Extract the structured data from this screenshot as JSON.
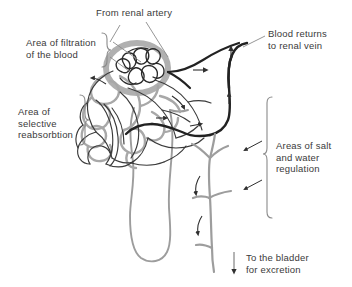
{
  "figure": {
    "background_color": "#ffffff",
    "tubule_color": "#9a9a9a",
    "vessel_color": "#333333",
    "text_color": "#3a3a3a"
  },
  "labels": {
    "renal_artery": "From renal artery",
    "filtration": "Area of filtration\nof the blood",
    "reabsorbtion": "Area of\nselective\nreabsorbtion",
    "renal_vein": "Blood returns\nto renal vein",
    "salt_water": "Areas of salt\nand water\nregulation",
    "bladder": "To the bladder\nfor excretion"
  },
  "icons": {
    "brace_right": "brace-right-icon",
    "brace_left": "brace-left-icon",
    "arrow_down": "arrow-down-icon",
    "flow_arrow": "flow-arrow-icon",
    "leader_line": "leader-line-icon"
  },
  "structures": {
    "glomerulus": "glomerulus-capillary-tuft",
    "bowmans_capsule": "bowmans-capsule",
    "convoluted_tubule": "convoluted-tubule",
    "loop_of_henle": "loop-of-henle",
    "collecting_duct": "collecting-duct",
    "peritubular_capillaries": "peritubular-capillary-network",
    "renal_artery_vessel": "renal-artery-vessel",
    "renal_vein_vessel": "renal-vein-vessel"
  }
}
